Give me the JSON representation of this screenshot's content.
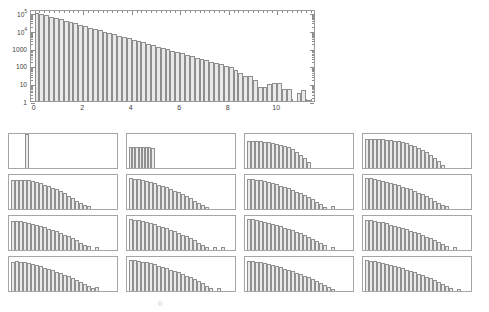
{
  "figure": {
    "background_color": "#ffffff",
    "bar_fill_color": "#e9e9e9",
    "bar_edge_color": "#8e8e8e",
    "axis_color": "#9a9a9a",
    "text_color": "#3d3d3d"
  },
  "footer": {
    "mark": "()"
  },
  "chart_data": [
    {
      "id": "main-histogram",
      "type": "bar",
      "title": "",
      "subtitle": "",
      "xlabel": "",
      "ylabel": "",
      "yscale": "log",
      "xscale": "linear",
      "grid": false,
      "legend": null,
      "xlim": [
        -0.15,
        11.6
      ],
      "ylim": [
        1,
        150000
      ],
      "xticks": [
        0,
        2,
        4,
        6,
        8,
        10
      ],
      "xtick_labels": [
        "0",
        "2",
        "4",
        "6",
        "8",
        "10"
      ],
      "yticks": [
        1,
        10,
        100,
        1000,
        10000,
        100000
      ],
      "ytick_labels": [
        "1",
        "10",
        "100",
        "1000",
        "10⁴",
        "10⁵"
      ],
      "bin_width": 0.2,
      "x": [
        0.1,
        0.3,
        0.5,
        0.7,
        0.9,
        1.1,
        1.3,
        1.5,
        1.7,
        1.9,
        2.1,
        2.3,
        2.5,
        2.7,
        2.9,
        3.1,
        3.3,
        3.5,
        3.7,
        3.9,
        4.1,
        4.3,
        4.5,
        4.7,
        4.9,
        5.1,
        5.3,
        5.5,
        5.7,
        5.9,
        6.1,
        6.3,
        6.5,
        6.7,
        6.9,
        7.1,
        7.3,
        7.5,
        7.7,
        7.9,
        8.1,
        8.3,
        8.5,
        8.7,
        8.9,
        9.1,
        9.3,
        9.5,
        9.7,
        9.9,
        10.1,
        10.3,
        10.5,
        10.7,
        10.9,
        11.1,
        11.3
      ],
      "values": [
        95000,
        80000,
        67000,
        56000,
        47000,
        39000,
        33000,
        27500,
        23000,
        19500,
        16200,
        13600,
        11400,
        9600,
        8000,
        6700,
        5600,
        4700,
        3950,
        3300,
        2800,
        2340,
        1960,
        1640,
        1380,
        1150,
        965,
        810,
        680,
        570,
        475,
        400,
        335,
        280,
        235,
        196,
        165,
        138,
        115,
        97,
        81,
        59,
        38,
        24,
        25,
        15,
        6,
        6,
        9,
        10,
        11,
        5,
        5,
        0,
        3,
        4,
        1
      ]
    },
    {
      "id": "panel-1",
      "type": "bar",
      "yscale": "log",
      "x": [
        0,
        1
      ],
      "values": [
        100,
        0
      ],
      "note": "single tall narrow bar at left"
    },
    {
      "id": "panel-2",
      "type": "bar",
      "yscale": "log",
      "values": [
        62,
        62,
        62,
        62,
        62,
        62,
        61,
        60
      ],
      "note": "flat block of uniform bars"
    },
    {
      "id": "panel-3",
      "type": "bar",
      "yscale": "log",
      "values": [
        80,
        80,
        79,
        78,
        77,
        76,
        74,
        72,
        69,
        66,
        61,
        55,
        47,
        38,
        28,
        18
      ]
    },
    {
      "id": "panel-4",
      "type": "bar",
      "yscale": "log",
      "values": [
        86,
        86,
        85,
        85,
        84,
        83,
        82,
        80,
        78,
        76,
        73,
        69,
        65,
        60,
        54,
        47,
        39,
        30,
        20,
        10
      ]
    },
    {
      "id": "panel-5",
      "type": "bar",
      "yscale": "log",
      "values": [
        84,
        86,
        86,
        85,
        84,
        82,
        79,
        76,
        72,
        68,
        63,
        58,
        52,
        46,
        39,
        32,
        25,
        18,
        13,
        10
      ]
    },
    {
      "id": "panel-6",
      "type": "bar",
      "yscale": "log",
      "values": [
        90,
        89,
        87,
        85,
        82,
        79,
        76,
        72,
        68,
        64,
        59,
        54,
        49,
        43,
        37,
        31,
        25,
        19,
        13,
        7
      ]
    },
    {
      "id": "panel-7",
      "type": "bar",
      "yscale": "log",
      "values": [
        88,
        87,
        86,
        84,
        82,
        79,
        76,
        73,
        69,
        65,
        61,
        56,
        51,
        46,
        40,
        34,
        28,
        21,
        14,
        7,
        0,
        8
      ]
    },
    {
      "id": "panel-8",
      "type": "bar",
      "yscale": "log",
      "values": [
        91,
        90,
        88,
        86,
        83,
        80,
        77,
        74,
        70,
        66,
        62,
        58,
        53,
        48,
        43,
        37,
        31,
        25,
        19,
        12,
        8
      ]
    },
    {
      "id": "panel-9",
      "type": "bar",
      "yscale": "log",
      "values": [
        84,
        85,
        84,
        82,
        80,
        77,
        74,
        71,
        67,
        63,
        59,
        55,
        50,
        45,
        40,
        34,
        28,
        22,
        16,
        11,
        0,
        9
      ]
    },
    {
      "id": "panel-10",
      "type": "bar",
      "yscale": "log",
      "values": [
        90,
        89,
        87,
        85,
        82,
        79,
        76,
        72,
        68,
        64,
        60,
        55,
        50,
        45,
        40,
        34,
        28,
        22,
        15,
        9,
        0,
        9,
        0,
        9
      ]
    },
    {
      "id": "panel-11",
      "type": "bar",
      "yscale": "log",
      "values": [
        92,
        90,
        88,
        86,
        83,
        80,
        77,
        74,
        70,
        66,
        62,
        58,
        54,
        49,
        44,
        39,
        33,
        27,
        21,
        14,
        0,
        8
      ]
    },
    {
      "id": "panel-12",
      "type": "bar",
      "yscale": "log",
      "values": [
        88,
        87,
        85,
        83,
        81,
        78,
        75,
        72,
        69,
        65,
        61,
        57,
        53,
        49,
        44,
        39,
        34,
        29,
        23,
        17,
        11,
        0,
        8
      ]
    },
    {
      "id": "panel-13",
      "type": "bar",
      "yscale": "log",
      "values": [
        86,
        87,
        86,
        84,
        82,
        79,
        76,
        73,
        69,
        65,
        61,
        57,
        53,
        48,
        43,
        38,
        32,
        26,
        20,
        14,
        9,
        11
      ]
    },
    {
      "id": "panel-14",
      "type": "bar",
      "yscale": "log",
      "values": [
        92,
        90,
        88,
        86,
        84,
        81,
        78,
        75,
        71,
        67,
        63,
        59,
        55,
        50,
        45,
        40,
        35,
        29,
        23,
        16,
        9,
        0,
        10
      ]
    },
    {
      "id": "panel-15",
      "type": "bar",
      "yscale": "log",
      "values": [
        89,
        88,
        86,
        84,
        82,
        79,
        76,
        73,
        70,
        66,
        62,
        58,
        54,
        50,
        45,
        40,
        35,
        30,
        24,
        18,
        12,
        7
      ]
    },
    {
      "id": "panel-16",
      "type": "bar",
      "yscale": "log",
      "values": [
        90,
        89,
        87,
        85,
        83,
        80,
        77,
        74,
        71,
        67,
        63,
        59,
        55,
        51,
        47,
        42,
        37,
        32,
        27,
        21,
        15,
        9,
        0,
        7
      ]
    }
  ]
}
